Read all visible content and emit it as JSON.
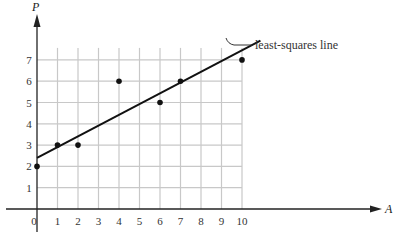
{
  "chart_data": {
    "type": "scatter",
    "title": "",
    "xlabel": "A",
    "ylabel": "P",
    "x_ticks": [
      "0",
      "1",
      "2",
      "3",
      "4",
      "5",
      "6",
      "7",
      "8",
      "9",
      "10"
    ],
    "y_ticks": [
      "1",
      "2",
      "3",
      "4",
      "5",
      "6",
      "7"
    ],
    "xlim": [
      0,
      10
    ],
    "ylim": [
      0,
      7
    ],
    "grid": true,
    "series": [
      {
        "name": "data points",
        "points": [
          {
            "x": 0,
            "y": 2
          },
          {
            "x": 1,
            "y": 3
          },
          {
            "x": 2,
            "y": 3
          },
          {
            "x": 4,
            "y": 6
          },
          {
            "x": 6,
            "y": 5
          },
          {
            "x": 7,
            "y": 6
          },
          {
            "x": 10,
            "y": 7
          }
        ]
      },
      {
        "name": "least-squares line",
        "type": "line",
        "points": [
          {
            "x": 0,
            "y": 2.4
          },
          {
            "x": 10.9,
            "y": 7.9
          }
        ]
      }
    ],
    "annotations": [
      {
        "text": "least-squares line",
        "points_to": {
          "x": 9.3,
          "y": 7.1
        }
      }
    ],
    "colors": {
      "grid": "#c8c8c8",
      "axis": "#222222",
      "points": "#111111",
      "line": "#111111"
    }
  }
}
